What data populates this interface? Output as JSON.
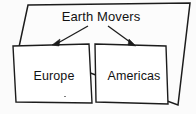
{
  "diagram": {
    "type": "hierarchy-box-diagram",
    "title": "Earth Movers",
    "background_color": "#fbfbfb",
    "stroke_color": "#1c1c1c",
    "fill_color": "#ffffff",
    "root": {
      "id": "earth-movers",
      "label": "Earth Movers",
      "shape": "quadrilateral",
      "points": "28,5 190,3 178,105 19,47"
    },
    "children": [
      {
        "id": "europe",
        "label": "Europe",
        "shape": "quadrilateral",
        "points": "13,46 89,44 92,103 16,102"
      },
      {
        "id": "americas",
        "label": "Americas",
        "shape": "quadrilateral",
        "points": "95,44 166,46 168,104 96,102"
      }
    ],
    "connectors": [
      {
        "id": "arrow-to-europe",
        "from": "earth-movers",
        "to": "europe",
        "line": {
          "x1": 88,
          "y1": 26,
          "x2": 58,
          "y2": 43
        },
        "head": "59,46 52,45 60,39"
      },
      {
        "id": "arrow-to-americas",
        "from": "earth-movers",
        "to": "americas",
        "line": {
          "x1": 108,
          "y1": 26,
          "x2": 130,
          "y2": 42
        },
        "head": "128,45 136,46 129,39"
      }
    ]
  }
}
